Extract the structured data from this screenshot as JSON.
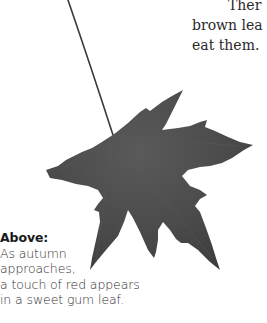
{
  "body_text": {
    "lines": [
      "Ther",
      "brown lea",
      "eat them."
    ]
  },
  "figure": {
    "subject": "sweet gum leaf",
    "leaf_color": "#4a4a4a",
    "stem_color": "#3a3a3a"
  },
  "caption": {
    "heading": "Above:",
    "lines": [
      "As autumn",
      "approaches,",
      "a touch of red appears",
      "in a sweet gum leaf."
    ]
  }
}
